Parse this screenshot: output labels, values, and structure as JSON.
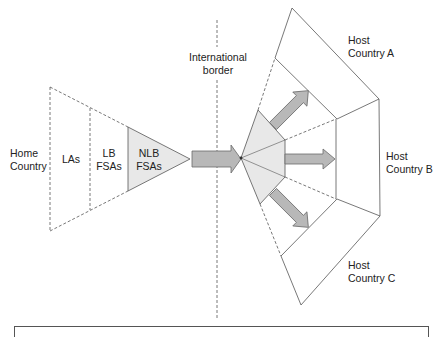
{
  "diagram": {
    "border_label": [
      "International",
      "border"
    ],
    "home": {
      "country_label": [
        "Home",
        "Country"
      ],
      "las_label": "LAs",
      "lb_fsas_label": [
        "LB",
        "FSAs"
      ],
      "nlb_fsas_label": [
        "NLB",
        "FSAs"
      ]
    },
    "hosts": [
      {
        "label": [
          "Host",
          "Country A"
        ]
      },
      {
        "label": [
          "Host",
          "Country B"
        ]
      },
      {
        "label": [
          "Host",
          "Country C"
        ]
      }
    ],
    "colors": {
      "line": "#555555",
      "fill_light": "#e8e8e8",
      "arrow_fill": "#b8b8b8",
      "arrow_stroke": "#6a6a6a"
    }
  }
}
